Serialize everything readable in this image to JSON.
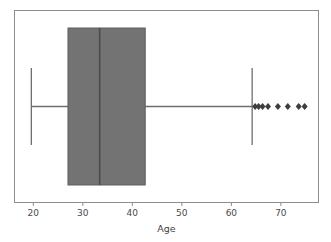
{
  "chart_data": {
    "type": "box",
    "title": "",
    "xlabel": "Age",
    "ylabel": "",
    "orientation": "horizontal",
    "xlim": [
      16.2,
      77.6
    ],
    "grid": false,
    "legend": null,
    "xticks": [
      20,
      30,
      40,
      50,
      60,
      70
    ],
    "xticklabels": [
      "20",
      "30",
      "40",
      "50",
      "60",
      "70"
    ],
    "series": [
      {
        "name": "Age",
        "min_whisker": 19.6,
        "q1": 27.0,
        "median": 33.4,
        "q3": 42.6,
        "max_whisker": 64.2,
        "outliers": [
          64.8,
          65.5,
          66.3,
          67.4,
          69.4,
          71.4,
          73.6,
          74.8
        ]
      }
    ],
    "colors": {
      "box_fill": "#737373",
      "box_edge": "#5f5f5f",
      "median": "#4a4a4a",
      "whisker": "#6e6e6e",
      "cap": "#6e6e6e",
      "outlier": "#3d3d3d",
      "frame": "#8c8c8c",
      "background": "#ffffff",
      "tick_text": "#4a4a4a"
    }
  },
  "axis": {
    "x_title": "Age",
    "ticks": [
      {
        "label": "20",
        "value": 20
      },
      {
        "label": "30",
        "value": 30
      },
      {
        "label": "40",
        "value": 40
      },
      {
        "label": "50",
        "value": 50
      },
      {
        "label": "60",
        "value": 60
      },
      {
        "label": "70",
        "value": 70
      }
    ]
  }
}
